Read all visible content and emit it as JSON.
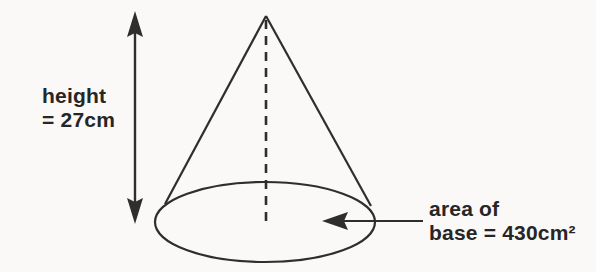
{
  "figure": {
    "type": "cone-diagram",
    "height": {
      "value": 27,
      "unit": "cm"
    },
    "base_area": {
      "value": 430,
      "unit": "cm²"
    }
  },
  "labels": {
    "height": {
      "line1": "height",
      "line2": "= 27cm"
    },
    "base_area": {
      "line1": "area of",
      "line2": "base = 430cm²"
    }
  },
  "colors": {
    "background": "#faf9f7",
    "line": "#2e2e2e",
    "text": "#262626"
  }
}
